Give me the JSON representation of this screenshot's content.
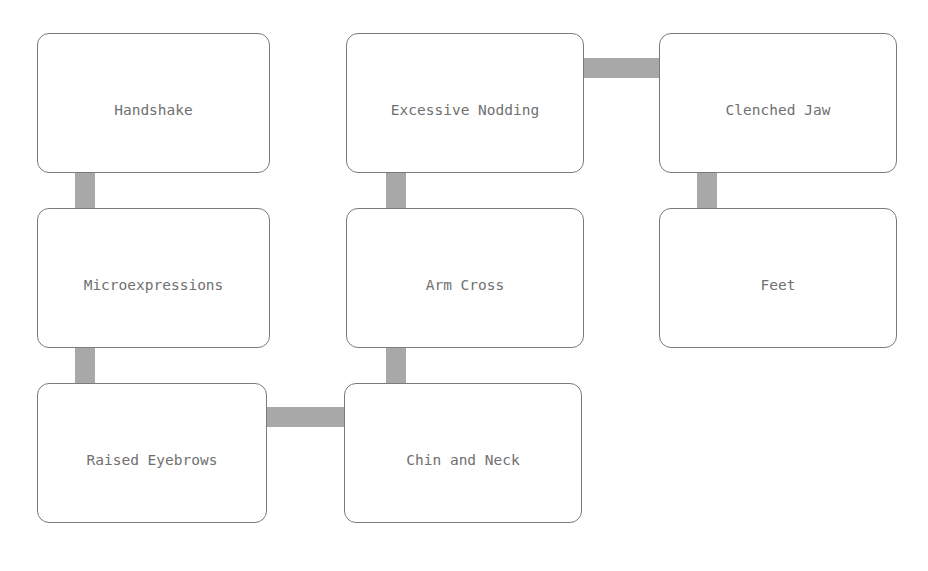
{
  "nodes": [
    {
      "id": "handshake",
      "label": "Handshake"
    },
    {
      "id": "microexpressions",
      "label": "Microexpressions"
    },
    {
      "id": "raised-eyebrows",
      "label": "Raised Eyebrows"
    },
    {
      "id": "excessive-nodding",
      "label": "Excessive Nodding"
    },
    {
      "id": "arm-cross",
      "label": "Arm Cross"
    },
    {
      "id": "chin-and-neck",
      "label": "Chin and Neck"
    },
    {
      "id": "clenched-jaw",
      "label": "Clenched Jaw"
    },
    {
      "id": "feet",
      "label": "Feet"
    }
  ],
  "edges": [
    {
      "from": "Handshake",
      "to": "Microexpressions"
    },
    {
      "from": "Microexpressions",
      "to": "Raised Eyebrows"
    },
    {
      "from": "Raised Eyebrows",
      "to": "Chin and Neck"
    },
    {
      "from": "Chin and Neck",
      "to": "Arm Cross"
    },
    {
      "from": "Arm Cross",
      "to": "Excessive Nodding"
    },
    {
      "from": "Excessive Nodding",
      "to": "Clenched Jaw"
    },
    {
      "from": "Clenched Jaw",
      "to": "Feet"
    }
  ],
  "colors": {
    "border": "#7a7a7a",
    "text": "#707070",
    "connector": "#a8a8a8"
  }
}
